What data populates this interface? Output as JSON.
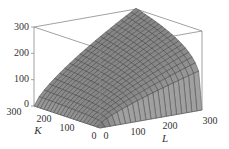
{
  "chart_data": {
    "type": "surface",
    "title": "",
    "function": "P(L, K) = 1.01 L^0.75 K^0.25",
    "function_params": {
      "b": 1.01,
      "alpha": 0.75
    },
    "x_axis": {
      "label": "L",
      "range": [
        0,
        300
      ],
      "ticks": [
        0,
        100,
        200,
        300
      ]
    },
    "y_axis": {
      "label": "K",
      "range": [
        0,
        300
      ],
      "ticks": [
        0,
        100,
        200,
        300
      ]
    },
    "z_axis": {
      "label": "",
      "range": [
        0,
        300
      ],
      "ticks": [
        0,
        100,
        200,
        300
      ]
    },
    "grid_divisions": 20,
    "box": true,
    "colors": {
      "surface": "#8c8c8c",
      "surface_light": "#a4a4a4",
      "surface_dark": "#6e6e6e",
      "mesh": "#3a3a3a",
      "box": "#8a8a8a",
      "text": "#333333"
    },
    "projection": {
      "origin": [
        100,
        128
      ],
      "l_unit": [
        102,
        -18
      ],
      "k_unit": [
        -66,
        -22
      ],
      "z_unit": [
        0,
        -79
      ]
    }
  },
  "labels": {
    "z_ticks": [
      "0",
      "100",
      "200",
      "300"
    ],
    "k_ticks": [
      "0",
      "100",
      "200",
      "300"
    ],
    "l_ticks": [
      "0",
      "100",
      "200",
      "300"
    ],
    "k_axis": "K",
    "l_axis": "L"
  }
}
